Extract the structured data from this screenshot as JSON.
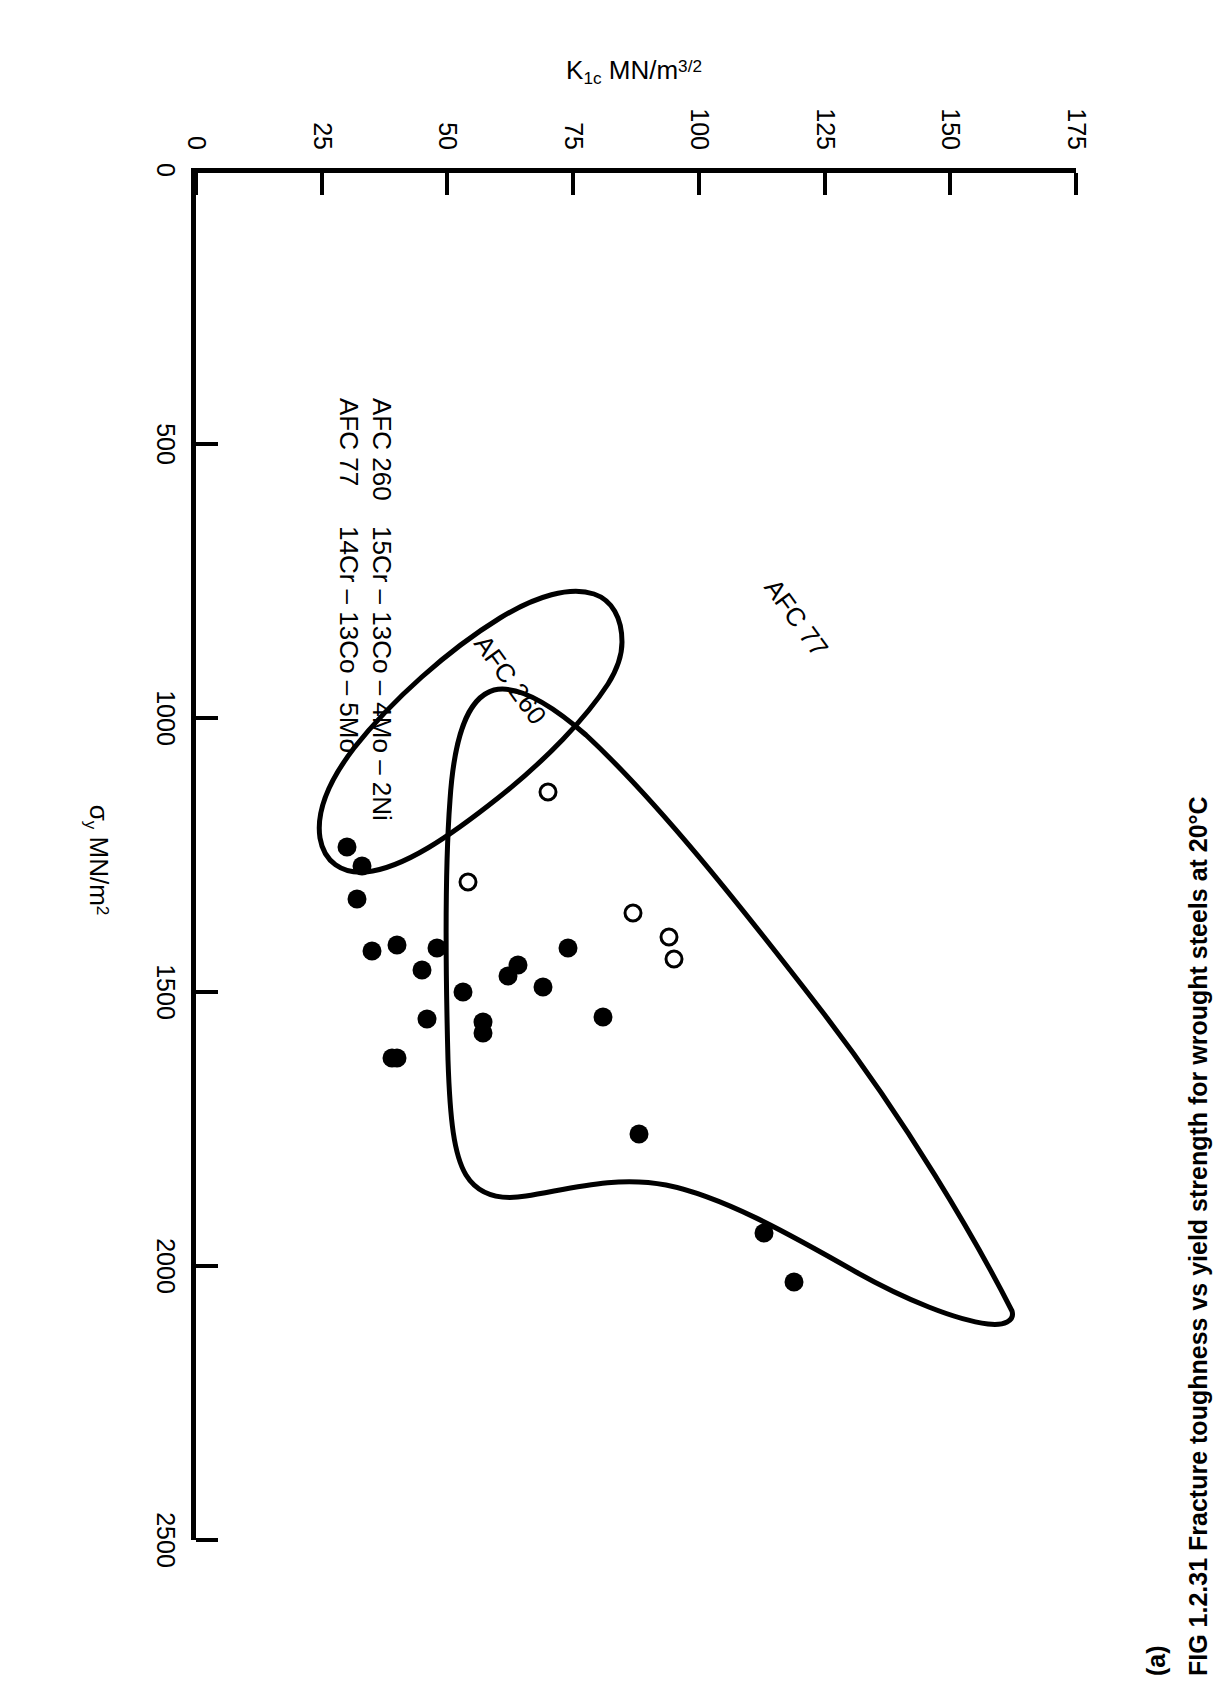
{
  "figure": {
    "panel_letter": "(a)",
    "caption": "FIG 1.2.31 Fracture toughness vs yield strength for wrought steels at 20°C"
  },
  "axes": {
    "x_title_main": "MN/m",
    "x_title_sigma": "σ",
    "x_title_sub": "y",
    "x_title_sup": "2",
    "y_title_k": "K",
    "y_title_sub": "1c",
    "y_title_main": "MN/m",
    "y_title_sup": "3/2",
    "x_ticks": [
      "0",
      "500",
      "1000",
      "1500",
      "2000",
      "2500"
    ],
    "y_ticks": [
      "0",
      "25",
      "50",
      "75",
      "100",
      "125",
      "150",
      "175"
    ]
  },
  "legend": {
    "rows": [
      {
        "name": "AFC 260",
        "composition": "15Cr – 13Co – 4Mo – 2Ni"
      },
      {
        "name": "AFC 77",
        "composition": "14Cr – 13Co – 5Mo"
      }
    ]
  },
  "annotations": {
    "afc77": "AFC 77",
    "afc260": "AFC 260"
  },
  "colors": {
    "ink": "#000000",
    "paper": "#ffffff"
  },
  "chart_data": {
    "type": "scatter",
    "title": "FIG 1.2.31 Fracture toughness vs yield strength for wrought steels at 20°C",
    "xlabel": "σy MN/m2",
    "ylabel": "K1c MN/m3/2",
    "xlim": [
      0,
      2500
    ],
    "ylim": [
      0,
      175
    ],
    "xticks": [
      0,
      500,
      1000,
      1500,
      2000,
      2500
    ],
    "yticks": [
      0,
      25,
      50,
      75,
      100,
      125,
      150,
      175
    ],
    "grid": false,
    "legend_position": "inside-lower-left",
    "series": [
      {
        "name": "AFC 77",
        "marker": "filled-circle",
        "composition": "14Cr – 13Co – 5Mo",
        "points": [
          [
            2030,
            119
          ],
          [
            1940,
            113
          ],
          [
            1760,
            88
          ],
          [
            1545,
            81
          ],
          [
            1490,
            69
          ],
          [
            1450,
            64
          ],
          [
            1470,
            62
          ],
          [
            1555,
            57
          ],
          [
            1575,
            57
          ],
          [
            1500,
            53
          ],
          [
            1420,
            74
          ],
          [
            1420,
            48
          ],
          [
            1550,
            46
          ],
          [
            1620,
            40
          ],
          [
            1620,
            39
          ],
          [
            1460,
            45
          ],
          [
            1415,
            40
          ],
          [
            1270,
            33
          ],
          [
            1330,
            32
          ],
          [
            1235,
            30
          ],
          [
            1425,
            35
          ]
        ]
      },
      {
        "name": "AFC 260",
        "marker": "open-circle",
        "composition": "15Cr – 13Co – 4Mo – 2Ni",
        "points": [
          [
            1440,
            95
          ],
          [
            1400,
            94
          ],
          [
            1355,
            87
          ],
          [
            1300,
            54
          ],
          [
            1135,
            70
          ]
        ]
      }
    ],
    "envelopes": [
      {
        "name": "AFC 77",
        "label": "AFC 77"
      },
      {
        "name": "AFC 260",
        "label": "AFC 260"
      }
    ]
  }
}
